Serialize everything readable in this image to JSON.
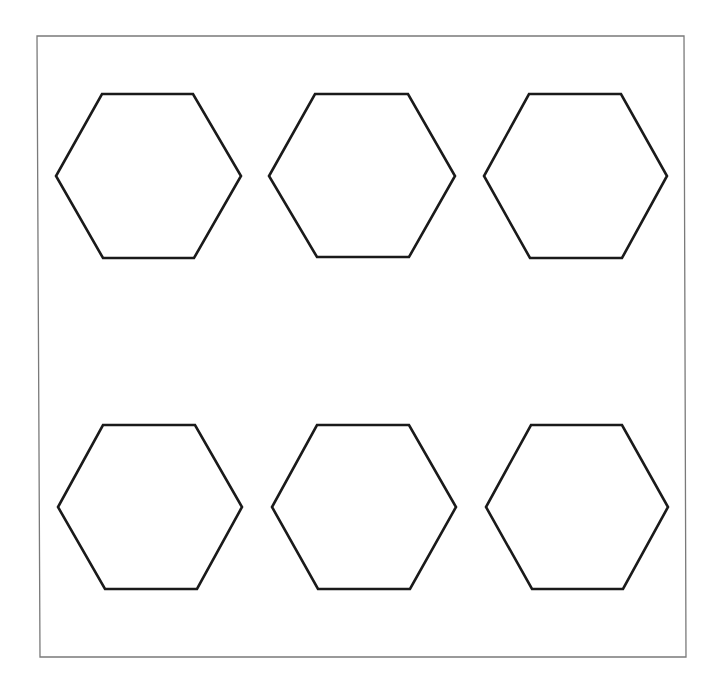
{
  "diagram": {
    "frame": {
      "points": "37,36 684,36 686,657 40,657",
      "stroke": "#7a7a7a",
      "stroke_width": 1.3
    },
    "shape_style": {
      "stroke": "#1a1a1a",
      "stroke_width": 2.6,
      "fill": "#ffffff"
    },
    "hexagons": [
      {
        "id": "hexagon-1",
        "row": 1,
        "col": 1,
        "points": "102,94 193,94 241,176 194,258 103,258 56,176"
      },
      {
        "id": "hexagon-2",
        "row": 1,
        "col": 2,
        "points": "315,94 408,94 455,176 409,257 317,257 269,176"
      },
      {
        "id": "hexagon-3",
        "row": 1,
        "col": 3,
        "points": "529,94 621,94 667,176 622,258 530,258 484,176"
      },
      {
        "id": "hexagon-4",
        "row": 2,
        "col": 1,
        "points": "103,425 195,425 242,507 197,589 105,589 58,507"
      },
      {
        "id": "hexagon-5",
        "row": 2,
        "col": 2,
        "points": "317,425 409,425 456,507 410,589 318,589 272,507"
      },
      {
        "id": "hexagon-6",
        "row": 2,
        "col": 3,
        "points": "531,425 622,425 668,507 623,589 532,589 486,507"
      }
    ]
  }
}
